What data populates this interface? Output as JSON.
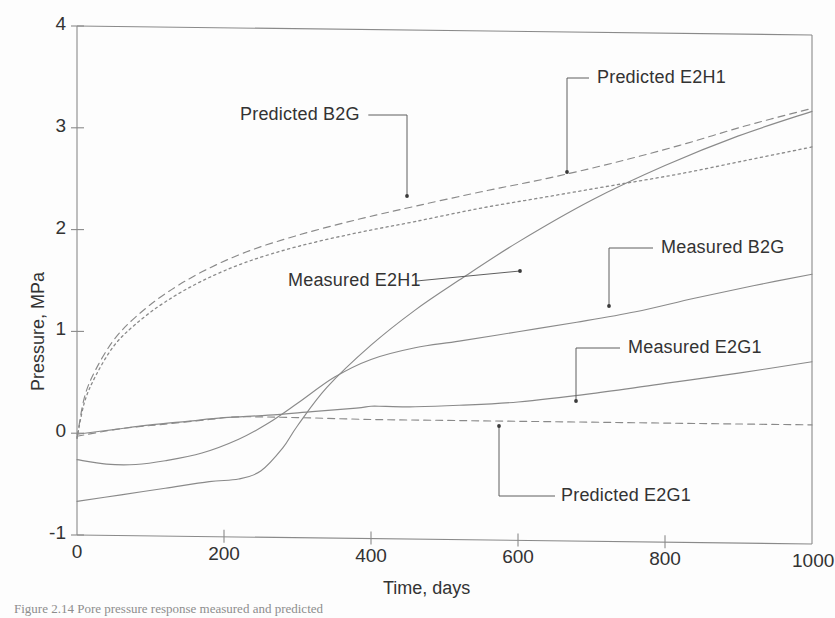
{
  "figure": {
    "caption": "Figure  2.14     Pore  pressure  response  measured  and  predicted",
    "background_color": "#fdfdfd",
    "line_color": "#8a8a8a",
    "text_color": "#333333"
  },
  "chart_data": {
    "type": "line",
    "title": "",
    "xlabel": "Time, days",
    "ylabel": "Pressure, MPa",
    "xlim": [
      0,
      1000
    ],
    "ylim": [
      -1,
      4
    ],
    "xticks": [
      0,
      200,
      400,
      600,
      800,
      1000
    ],
    "yticks": [
      -1,
      0,
      1,
      2,
      3,
      4
    ],
    "xtick_labels": [
      "0",
      "200",
      "400",
      "600",
      "800",
      "1000"
    ],
    "ytick_labels": [
      "-1",
      "0",
      "1",
      "2",
      "3",
      "4"
    ],
    "grid": false,
    "legend_position": "inline-annotations",
    "series": [
      {
        "name": "Predicted B2G",
        "style": "dashed",
        "x": [
          0,
          10,
          25,
          50,
          80,
          120,
          170,
          230,
          300,
          380,
          460,
          550,
          640,
          730,
          820,
          910,
          1000
        ],
        "y": [
          -0.05,
          0.35,
          0.62,
          0.92,
          1.15,
          1.38,
          1.6,
          1.8,
          1.97,
          2.13,
          2.27,
          2.42,
          2.56,
          2.72,
          2.9,
          3.1,
          3.28
        ]
      },
      {
        "name": "Predicted E2H1",
        "style": "dotted",
        "x": [
          0,
          10,
          25,
          50,
          80,
          120,
          170,
          230,
          300,
          380,
          460,
          550,
          640,
          730,
          820,
          910,
          1000
        ],
        "y": [
          -0.05,
          0.3,
          0.56,
          0.86,
          1.08,
          1.3,
          1.51,
          1.7,
          1.86,
          2.0,
          2.12,
          2.26,
          2.38,
          2.5,
          2.62,
          2.76,
          2.9
        ]
      },
      {
        "name": "Measured E2H1",
        "style": "solid",
        "x": [
          0,
          60,
          120,
          180,
          220,
          250,
          280,
          300,
          340,
          400,
          460,
          520,
          600,
          700,
          800,
          900,
          1000
        ],
        "y": [
          -0.67,
          -0.6,
          -0.53,
          -0.46,
          -0.43,
          -0.35,
          -0.12,
          0.1,
          0.48,
          0.9,
          1.25,
          1.55,
          1.93,
          2.35,
          2.7,
          3.0,
          3.25
        ]
      },
      {
        "name": "Measured B2G",
        "style": "solid",
        "x": [
          0,
          40,
          80,
          120,
          170,
          220,
          260,
          300,
          350,
          400,
          460,
          520,
          600,
          680,
          760,
          840,
          920,
          1000
        ],
        "y": [
          -0.26,
          -0.3,
          -0.3,
          -0.26,
          -0.18,
          -0.04,
          0.12,
          0.32,
          0.58,
          0.76,
          0.88,
          0.95,
          1.05,
          1.15,
          1.26,
          1.4,
          1.53,
          1.65
        ]
      },
      {
        "name": "Measured E2G1",
        "style": "solid",
        "x": [
          0,
          50,
          100,
          150,
          200,
          260,
          320,
          380,
          400,
          420,
          460,
          520,
          600,
          700,
          800,
          900,
          1000
        ],
        "y": [
          -0.01,
          0.04,
          0.09,
          0.13,
          0.17,
          0.2,
          0.24,
          0.28,
          0.3,
          0.3,
          0.3,
          0.32,
          0.36,
          0.45,
          0.56,
          0.67,
          0.79
        ]
      },
      {
        "name": "Predicted E2G1",
        "style": "dashed",
        "x": [
          0,
          60,
          120,
          180,
          220,
          300,
          400,
          500,
          600,
          700,
          800,
          900,
          1000
        ],
        "y": [
          -0.03,
          0.05,
          0.1,
          0.15,
          0.18,
          0.18,
          0.17,
          0.17,
          0.17,
          0.17,
          0.17,
          0.17,
          0.17
        ]
      }
    ],
    "annotations": [
      {
        "text": "Predicted B2G",
        "label_x": 240,
        "label_y": 104,
        "point": [
          407,
          196
        ]
      },
      {
        "text": "Predicted E2H1",
        "label_x": 597,
        "label_y": 67,
        "point": [
          567,
          172
        ]
      },
      {
        "text": "Measured E2H1",
        "label_x": 288,
        "label_y": 270,
        "point": [
          520,
          271
        ]
      },
      {
        "text": "Measured B2G",
        "label_x": 661,
        "label_y": 237,
        "point": [
          609,
          306
        ]
      },
      {
        "text": "Measured E2G1",
        "label_x": 628,
        "label_y": 337,
        "point": [
          576,
          401
        ]
      },
      {
        "text": "Predicted E2G1",
        "label_x": 561,
        "label_y": 485,
        "point": [
          499,
          426
        ]
      }
    ]
  }
}
